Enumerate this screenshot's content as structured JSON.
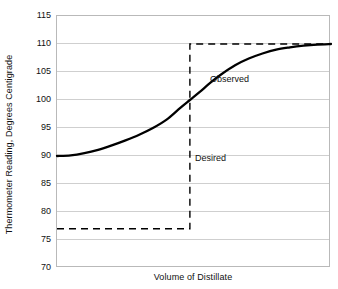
{
  "chart_data": {
    "type": "line",
    "title": "",
    "subtitle": "",
    "xlabel": "Volume of Distillate",
    "ylabel": "Thermometer Reading, Degrees Centigrade",
    "ylim": [
      70,
      115
    ],
    "yticks": [
      115,
      110,
      105,
      100,
      95,
      90,
      85,
      80,
      75,
      70
    ],
    "ytick_labels": [
      "115",
      "110",
      "105",
      "100",
      "95",
      "90",
      "85",
      "80",
      "75",
      "70"
    ],
    "xlim": [
      0,
      100
    ],
    "xticks": [],
    "xtick_labels": [],
    "grid": "horizontal",
    "legend_position": "none",
    "series": [
      {
        "name": "Observed",
        "style": "solid",
        "color": "#000000",
        "x": [
          0,
          5,
          10,
          15,
          20,
          25,
          30,
          35,
          40,
          45,
          48.5,
          52,
          56,
          60,
          65,
          70,
          75,
          80,
          85,
          90,
          95,
          100
        ],
        "y": [
          90.0,
          90.1,
          90.5,
          91.1,
          91.9,
          92.8,
          93.8,
          95.0,
          96.5,
          98.6,
          100.0,
          101.4,
          103.1,
          104.6,
          106.2,
          107.4,
          108.3,
          109.0,
          109.4,
          109.7,
          109.9,
          110.0
        ]
      },
      {
        "name": "Desired",
        "style": "dashed",
        "color": "#000000",
        "description": "step: 77 degrees until midpoint, then vertical rise to 110 degrees",
        "x": [
          0,
          48.5,
          48.5,
          100
        ],
        "y": [
          77,
          77,
          110,
          110
        ]
      }
    ],
    "annotations": [
      {
        "text": "Observed",
        "x": 55.8,
        "y": 103.7
      },
      {
        "text": "Desired",
        "x": 50.4,
        "y": 89.6
      }
    ]
  },
  "axis": {
    "x_title": "Volume of Distillate",
    "y_title": "Thermometer Reading, Degrees Centigrade",
    "y_tick_labels": [
      "115",
      "110",
      "105",
      "100",
      "95",
      "90",
      "85",
      "80",
      "75",
      "70"
    ]
  },
  "labels": {
    "observed": "Observed",
    "desired": "Desired"
  },
  "colors": {
    "curve": "#000000",
    "dashed": "#000000",
    "grid": "#cfcfcf",
    "frame": "#b9b9b9",
    "background": "#ffffff",
    "text": "#111111"
  }
}
